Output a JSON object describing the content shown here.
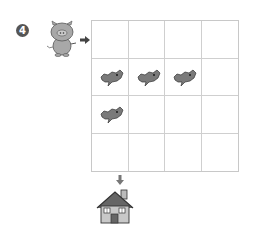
{
  "problem": {
    "number": "4",
    "description": "Maze puzzle: guide the pig from the start arrow through the grid to the house, avoiding wolves",
    "grid": {
      "rows": 4,
      "cols": 4,
      "cells": [
        [
          "",
          "",
          "",
          ""
        ],
        [
          "wolf",
          "wolf",
          "wolf",
          ""
        ],
        [
          "wolf",
          "",
          "",
          ""
        ],
        [
          "",
          "",
          "",
          ""
        ]
      ]
    },
    "start": {
      "character": "pig",
      "entry": "left of row 1, col 1",
      "arrow": "right"
    },
    "goal": {
      "character": "house",
      "entry": "below row 4, col 1",
      "arrow": "down"
    },
    "colors": {
      "wolf": "#7a7a7a",
      "pig": "#a8a8a8",
      "grid_line": "#cfcfcf",
      "badge": "#555555"
    }
  }
}
